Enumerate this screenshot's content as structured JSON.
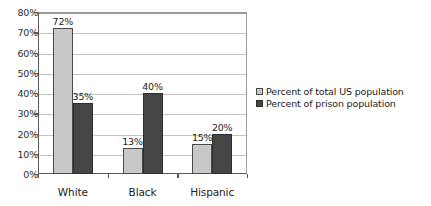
{
  "chart_data": {
    "type": "bar",
    "title": "",
    "xlabel": "",
    "ylabel": "",
    "categories": [
      "White",
      "Black",
      "Hispanic"
    ],
    "series": [
      {
        "name": "Percent of total US population",
        "color": "#c8c8c8",
        "values": [
          72,
          13,
          15
        ],
        "data_labels": [
          "72%",
          "13%",
          "15%"
        ]
      },
      {
        "name": "Percent of prison population",
        "color": "#454545",
        "values": [
          35,
          40,
          20
        ],
        "data_labels": [
          "35%",
          "40%",
          "20%"
        ]
      }
    ],
    "ylim": [
      0,
      80
    ],
    "ytick_values": [
      0,
      10,
      20,
      30,
      40,
      50,
      60,
      70,
      80
    ],
    "ytick_labels": [
      "0%",
      "10%",
      "20%",
      "30%",
      "40%",
      "50%",
      "60%",
      "70%",
      "80%"
    ],
    "grid": true,
    "grid_axis": "y",
    "legend_position": "right",
    "plot_background": "#ffffff",
    "grid_color": "#c4c4c4",
    "axis_color": "#5a5a5a"
  }
}
